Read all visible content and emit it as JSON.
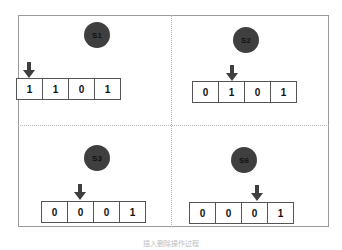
{
  "caption": "插入删除操作过程",
  "colors": {
    "node_fill": "#3f3f3f",
    "border": "#555555",
    "frame": "#9a9a9a"
  },
  "states": [
    {
      "label": "S1",
      "cells": [
        "1",
        "1",
        "0",
        "1"
      ],
      "pointer_index": 0
    },
    {
      "label": "S2",
      "cells": [
        "0",
        "1",
        "0",
        "1"
      ],
      "pointer_index": 1
    },
    {
      "label": "S3",
      "cells": [
        "0",
        "0",
        "0",
        "1"
      ],
      "pointer_index": 1
    },
    {
      "label": "S6",
      "cells": [
        "0",
        "0",
        "0",
        "1"
      ],
      "pointer_index": 2
    }
  ]
}
